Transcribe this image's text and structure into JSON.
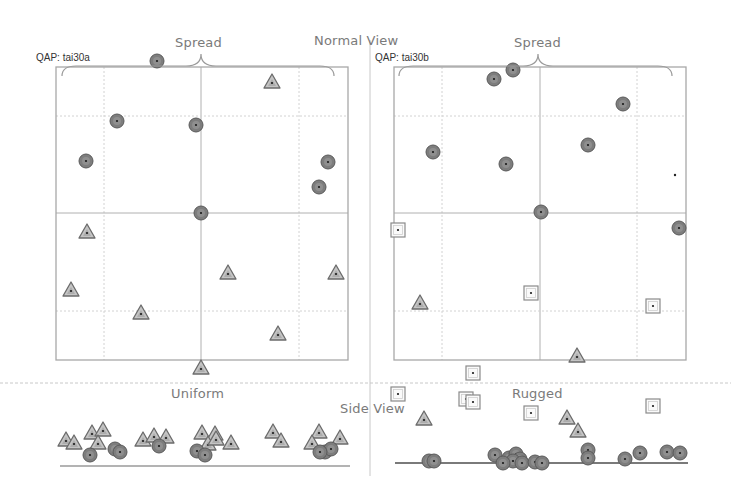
{
  "labels": {
    "normal_view": "Normal View",
    "side_view": "Side View",
    "left_panel_qap": "QAP: tai30a",
    "right_panel_qap": "QAP: tai30b",
    "left_brace": "Spread",
    "right_brace": "Spread",
    "left_side": "Uniform",
    "right_side": "Rugged"
  },
  "colors": {
    "grid": "#bdbdbd",
    "frame": "#a8a8a8",
    "circle_fill": "#7d7d7d",
    "circle_ring": "#555555",
    "triangle_fill": "#b9b9b9",
    "triangle_stroke": "#6b6b6b",
    "square_stroke": "#8a8a8a",
    "baseline": "#888888"
  },
  "panels": [
    {
      "id": "tai30a",
      "frame": {
        "x": 56,
        "y": 67,
        "w": 292,
        "h": 293
      },
      "vgrid": [
        104,
        201,
        299
      ],
      "hgrid": [
        116,
        213,
        311
      ],
      "circles": [
        [
          157,
          61
        ],
        [
          117,
          121
        ],
        [
          196,
          125
        ],
        [
          86,
          161
        ],
        [
          328,
          162
        ],
        [
          319,
          187
        ],
        [
          201,
          213
        ]
      ],
      "triangles": [
        [
          272,
          82
        ],
        [
          87,
          232
        ],
        [
          71,
          290
        ],
        [
          228,
          273
        ],
        [
          336,
          273
        ],
        [
          141,
          313
        ],
        [
          278,
          334
        ],
        [
          201,
          368
        ]
      ],
      "squares": []
    },
    {
      "id": "tai30b",
      "frame": {
        "x": 394,
        "y": 67,
        "w": 292,
        "h": 293
      },
      "vgrid": [
        442,
        540,
        637
      ],
      "hgrid": [
        116,
        213,
        311
      ],
      "circles": [
        [
          513,
          70
        ],
        [
          494,
          79
        ],
        [
          623,
          104
        ],
        [
          433,
          152
        ],
        [
          506,
          164
        ],
        [
          588,
          145
        ],
        [
          541,
          212
        ],
        [
          679,
          228
        ]
      ],
      "triangles": [
        [
          420,
          303
        ],
        [
          577,
          356
        ]
      ],
      "squares": [
        [
          398,
          230
        ],
        [
          531,
          293
        ],
        [
          653,
          306
        ],
        [
          473,
          373
        ],
        [
          398,
          394
        ],
        [
          466,
          399
        ],
        [
          473,
          402
        ],
        [
          531,
          413
        ],
        [
          653,
          406
        ]
      ],
      "dots": [
        [
          675,
          175
        ]
      ]
    }
  ],
  "side_views": [
    {
      "id": "uniform",
      "baseline": {
        "x1": 60,
        "x2": 350,
        "y": 466
      },
      "triangles": [
        [
          66,
          440
        ],
        [
          74,
          443
        ],
        [
          92,
          433
        ],
        [
          103,
          430
        ],
        [
          98,
          443
        ],
        [
          143,
          440
        ],
        [
          154,
          436
        ],
        [
          166,
          437
        ],
        [
          202,
          433
        ],
        [
          215,
          434
        ],
        [
          208,
          444
        ],
        [
          216,
          439
        ],
        [
          231,
          443
        ],
        [
          273,
          432
        ],
        [
          281,
          441
        ],
        [
          319,
          432
        ],
        [
          340,
          438
        ],
        [
          312,
          443
        ]
      ],
      "circles": [
        [
          90,
          455
        ],
        [
          115,
          449
        ],
        [
          120,
          452
        ],
        [
          159,
          446
        ],
        [
          197,
          451
        ],
        [
          205,
          455
        ],
        [
          325,
          452
        ],
        [
          331,
          449
        ],
        [
          320,
          452
        ]
      ]
    },
    {
      "id": "rugged",
      "baseline": {
        "x1": 395,
        "x2": 688,
        "y": 463
      },
      "triangles": [
        [
          424,
          419
        ],
        [
          567,
          418
        ],
        [
          578,
          431
        ]
      ],
      "circles": [
        [
          429,
          461
        ],
        [
          434,
          461
        ],
        [
          495,
          455
        ],
        [
          509,
          458
        ],
        [
          516,
          454
        ],
        [
          520,
          459
        ],
        [
          513,
          461
        ],
        [
          503,
          463
        ],
        [
          522,
          463
        ],
        [
          535,
          462
        ],
        [
          542,
          463
        ],
        [
          588,
          450
        ],
        [
          588,
          458
        ],
        [
          625,
          459
        ],
        [
          640,
          453
        ],
        [
          667,
          452
        ],
        [
          680,
          453
        ]
      ],
      "squares": [
        [
          531,
          413
        ]
      ]
    }
  ]
}
